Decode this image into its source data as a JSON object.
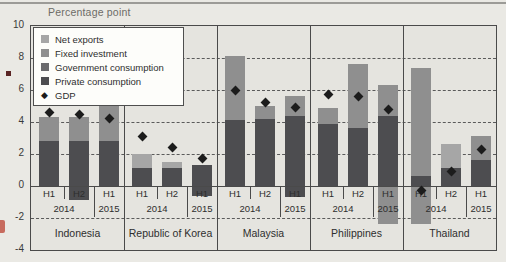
{
  "page": {
    "figure_type": "stacked bar chart with GDP markers"
  },
  "colors": {
    "page_bg": "#eae9e4",
    "plot_bg": "#e5e4df",
    "axis": "#4a4a4a",
    "text": "#2e2e2e",
    "shade_dark": "#4d4d50",
    "shade_gov": "#6a6a6d",
    "shade_medium": "#8f8f8f",
    "shade_light": "#a6a6a6",
    "gdp_marker": "#1c1c1c",
    "legend_bg": "#fdfdfa",
    "margin_bullet": "#5a2424",
    "margin_red_mark": "#c76b5e"
  },
  "legend": {
    "items": [
      {
        "label": "Net exports",
        "shade": "light",
        "marker": "square"
      },
      {
        "label": "Fixed investment",
        "shade": "medium",
        "marker": "square"
      },
      {
        "label": "Government consumption",
        "shade": "gov",
        "marker": "square"
      },
      {
        "label": "Private consumption",
        "shade": "dark",
        "marker": "square"
      },
      {
        "label": "GDP",
        "shade": "gdp",
        "marker": "diamond"
      }
    ]
  },
  "chart_data": {
    "type": "bar",
    "stacked": true,
    "ylabel": "Percentage point",
    "ylim": [
      -4,
      10
    ],
    "yticks": [
      10,
      8,
      6,
      4,
      2,
      0,
      -2,
      -4
    ],
    "grid": "dashed horizontal at 8,6,4,2,-2; solid at 0",
    "legend_position": "top-left inside plot",
    "gdp_marker_style": "black diamond",
    "groups": [
      {
        "country": "Indonesia",
        "bars": [
          {
            "period": "H1",
            "year": "2014",
            "gdp": 4.6,
            "segments": [
              {
                "component": "Private consumption",
                "from": 0,
                "to": 2.8,
                "shade": "dark"
              },
              {
                "component": "Fixed investment",
                "from": 2.8,
                "to": 4.3,
                "shade": "medium"
              }
            ]
          },
          {
            "period": "H2",
            "year": "2014",
            "gdp": 4.5,
            "segments": [
              {
                "component": "Private consumption",
                "from": 0,
                "to": 2.8,
                "shade": "dark"
              },
              {
                "component": "Fixed investment",
                "from": 2.8,
                "to": 4.3,
                "shade": "medium"
              },
              {
                "component": "Net exports",
                "from": 0,
                "to": -0.9,
                "shade": "dark"
              }
            ]
          },
          {
            "period": "H1",
            "year": "2015",
            "gdp": 4.2,
            "segments": [
              {
                "component": "Private consumption",
                "from": 0,
                "to": 2.8,
                "shade": "dark"
              },
              {
                "component": "Fixed investment",
                "from": 2.8,
                "to": 5.0,
                "shade": "medium"
              }
            ]
          }
        ]
      },
      {
        "country": "Republic of Korea",
        "bars": [
          {
            "period": "H1",
            "year": "2014",
            "gdp": 3.1,
            "segments": [
              {
                "component": "Private consumption",
                "from": 0,
                "to": 1.1,
                "shade": "dark"
              },
              {
                "component": "Net exports",
                "from": 1.1,
                "to": 2.0,
                "shade": "light"
              }
            ]
          },
          {
            "period": "H2",
            "year": "2014",
            "gdp": 2.4,
            "segments": [
              {
                "component": "Private consumption",
                "from": 0,
                "to": 1.1,
                "shade": "dark"
              },
              {
                "component": "Net exports",
                "from": 1.1,
                "to": 1.5,
                "shade": "light"
              }
            ]
          },
          {
            "period": "H1",
            "year": "2015",
            "gdp": 1.7,
            "segments": [
              {
                "component": "Private consumption",
                "from": 0,
                "to": 1.3,
                "shade": "dark"
              },
              {
                "component": "Net exports",
                "from": 0,
                "to": -0.6,
                "shade": "dark"
              }
            ]
          }
        ]
      },
      {
        "country": "Malaysia",
        "bars": [
          {
            "period": "H1",
            "year": "2014",
            "gdp": 6.0,
            "segments": [
              {
                "component": "Private consumption",
                "from": 0,
                "to": 4.1,
                "shade": "dark"
              },
              {
                "component": "Fixed investment",
                "from": 4.1,
                "to": 8.1,
                "shade": "medium"
              }
            ]
          },
          {
            "period": "H2",
            "year": "2014",
            "gdp": 5.2,
            "segments": [
              {
                "component": "Private consumption",
                "from": 0,
                "to": 4.2,
                "shade": "dark"
              },
              {
                "component": "Fixed investment",
                "from": 4.2,
                "to": 5.0,
                "shade": "medium"
              }
            ]
          },
          {
            "period": "H1",
            "year": "2015",
            "gdp": 4.9,
            "segments": [
              {
                "component": "Private consumption",
                "from": 0,
                "to": 4.4,
                "shade": "dark"
              },
              {
                "component": "Fixed investment",
                "from": 4.4,
                "to": 5.6,
                "shade": "medium"
              },
              {
                "component": "Net exports",
                "from": 0,
                "to": -0.7,
                "shade": "dark"
              }
            ]
          }
        ]
      },
      {
        "country": "Philippines",
        "bars": [
          {
            "period": "H1",
            "year": "2014",
            "gdp": 5.7,
            "segments": [
              {
                "component": "Private consumption",
                "from": 0,
                "to": 3.9,
                "shade": "dark"
              },
              {
                "component": "Fixed investment",
                "from": 3.9,
                "to": 4.9,
                "shade": "medium"
              }
            ]
          },
          {
            "period": "H2",
            "year": "2014",
            "gdp": 5.6,
            "segments": [
              {
                "component": "Private consumption",
                "from": 0,
                "to": 3.6,
                "shade": "dark"
              },
              {
                "component": "Fixed investment",
                "from": 3.6,
                "to": 7.6,
                "shade": "medium"
              }
            ]
          },
          {
            "period": "H1",
            "year": "2015",
            "gdp": 4.8,
            "segments": [
              {
                "component": "Private consumption",
                "from": 0,
                "to": 4.4,
                "shade": "dark"
              },
              {
                "component": "Fixed investment",
                "from": 4.4,
                "to": 6.3,
                "shade": "medium"
              },
              {
                "component": "Net exports",
                "from": 0,
                "to": -2.4,
                "shade": "medium"
              }
            ]
          }
        ]
      },
      {
        "country": "Thailand",
        "bars": [
          {
            "period": "H1",
            "year": "2014",
            "gdp": -0.3,
            "segments": [
              {
                "component": "Private consumption",
                "from": 0,
                "to": 0.6,
                "shade": "dark"
              },
              {
                "component": "Fixed investment",
                "from": 0.6,
                "to": 7.4,
                "shade": "medium"
              },
              {
                "component": "Net exports",
                "from": 0,
                "to": -2.4,
                "shade": "medium"
              }
            ]
          },
          {
            "period": "H2",
            "year": "2014",
            "gdp": 0.9,
            "segments": [
              {
                "component": "Private consumption",
                "from": 0,
                "to": 1.1,
                "shade": "dark"
              },
              {
                "component": "Net exports",
                "from": 1.1,
                "to": 2.6,
                "shade": "light"
              }
            ]
          },
          {
            "period": "H1",
            "year": "2015",
            "gdp": 2.3,
            "segments": [
              {
                "component": "Private consumption",
                "from": 0,
                "to": 1.6,
                "shade": "dark"
              },
              {
                "component": "Fixed investment",
                "from": 1.6,
                "to": 3.1,
                "shade": "medium"
              }
            ]
          }
        ]
      }
    ]
  }
}
